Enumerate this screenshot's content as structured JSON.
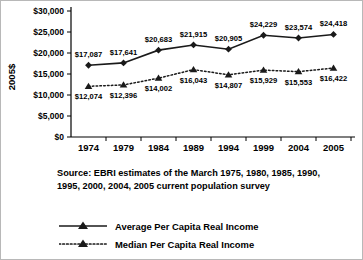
{
  "chart_data": {
    "type": "line",
    "title": "",
    "xlabel": "",
    "ylabel": "2005$",
    "ylim": [
      0,
      30000
    ],
    "ytick_values": [
      0,
      5000,
      10000,
      15000,
      20000,
      25000,
      30000
    ],
    "ytick_labels": [
      "$0",
      "$5,000",
      "$10,000",
      "$15,000",
      "$20,000",
      "$25,000",
      "$30,000"
    ],
    "grid": false,
    "legend_position": "bottom",
    "categories": [
      "1974",
      "1979",
      "1984",
      "1989",
      "1994",
      "1999",
      "2004",
      "2005"
    ],
    "series": [
      {
        "name": "Average Per Capita Real Income",
        "marker": "diamond",
        "linestyle": "solid",
        "color": "#1a1a1a",
        "values": [
          17087,
          17641,
          20683,
          21915,
          20905,
          24229,
          23574,
          24418
        ],
        "labels": [
          "$17,087",
          "$17,641",
          "$20,683",
          "$21,915",
          "$20,905",
          "$24,229",
          "$23,574",
          "$24,418"
        ]
      },
      {
        "name": "Median Per Capita Real Income",
        "marker": "triangle",
        "linestyle": "dotted",
        "color": "#1a1a1a",
        "values": [
          12074,
          12396,
          14002,
          16043,
          14807,
          15929,
          15553,
          16422
        ],
        "labels": [
          "$12,074",
          "$12,396",
          "$14,002",
          "$16,043",
          "$14,807",
          "$15,929",
          "$15,553",
          "$16,422"
        ]
      }
    ]
  },
  "source": {
    "line1": "Source: EBRI estimates of the March 1975, 1980, 1985, 1990,",
    "line2": "1995, 2000, 2004, 2005 current population survey"
  },
  "legend": {
    "items": [
      {
        "label": "Average Per Capita Real Income",
        "style": "solid",
        "marker": "triangle"
      },
      {
        "label": "Median Per Capita Real Income",
        "style": "dotted",
        "marker": "triangle"
      }
    ]
  }
}
